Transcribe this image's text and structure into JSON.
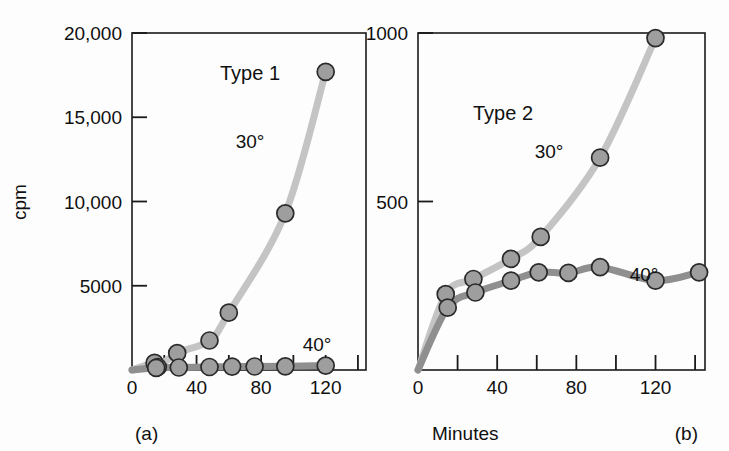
{
  "figure": {
    "background_color": "#fdfdfd",
    "axis_color": "#1a1a1a",
    "marker_fill": "#9e9e9e",
    "marker_stroke": "#2a2a2a",
    "curve_color_30": "#c4c4c4",
    "curve_color_40": "#8f8f8f",
    "shared_xlabel": "Minutes"
  },
  "panels": {
    "a": {
      "letter": "(a)",
      "title": "Type 1",
      "ylabel": "cpm",
      "y_ticks": [
        "5000",
        "10,000",
        "15,000",
        "20,000"
      ],
      "x_ticks": [
        "0",
        "40",
        "80",
        "120"
      ],
      "series_labels": {
        "hot": "30°",
        "cold": "40°"
      }
    },
    "b": {
      "letter": "(b)",
      "title": "Type 2",
      "ylabel": "",
      "y_ticks": [
        "500",
        "1000"
      ],
      "x_ticks": [
        "0",
        "40",
        "80",
        "120"
      ],
      "series_labels": {
        "hot": "30°",
        "cold": "40°"
      }
    }
  },
  "chart_data": [
    {
      "type": "line",
      "panel": "a",
      "title": "Type 1",
      "xlabel": "Minutes",
      "ylabel": "cpm",
      "xlim": [
        0,
        145
      ],
      "ylim": [
        0,
        20000
      ],
      "xticks": [
        0,
        20,
        40,
        60,
        80,
        100,
        120,
        140
      ],
      "xticklabels": [
        "0",
        "",
        "40",
        "",
        "80",
        "",
        "120",
        ""
      ],
      "yticks": [
        5000,
        10000,
        15000,
        20000
      ],
      "yticklabels": [
        "5000",
        "10,000",
        "15,000",
        "20,000"
      ],
      "grid": false,
      "legend": "inline-annotations",
      "series": [
        {
          "name": "30°",
          "color": "#c4c4c4",
          "x": [
            14,
            16,
            28,
            48,
            60,
            95,
            120
          ],
          "y": [
            420,
            180,
            1000,
            1750,
            3400,
            9300,
            17700
          ]
        },
        {
          "name": "40°",
          "color": "#8f8f8f",
          "x": [
            15,
            29,
            48,
            62,
            76,
            95,
            120
          ],
          "y": [
            130,
            150,
            180,
            200,
            210,
            220,
            260
          ]
        }
      ]
    },
    {
      "type": "line",
      "panel": "b",
      "title": "Type 2",
      "xlabel": "Minutes",
      "ylabel": "",
      "xlim": [
        0,
        145
      ],
      "ylim": [
        0,
        1000
      ],
      "xticks": [
        0,
        20,
        40,
        60,
        80,
        100,
        120,
        140
      ],
      "xticklabels": [
        "0",
        "",
        "40",
        "",
        "80",
        "",
        "120",
        ""
      ],
      "yticks": [
        500,
        1000
      ],
      "yticklabels": [
        "500",
        "1000"
      ],
      "grid": false,
      "legend": "inline-annotations",
      "series": [
        {
          "name": "30°",
          "color": "#c4c4c4",
          "x": [
            14,
            28,
            47,
            62,
            92,
            120
          ],
          "y": [
            225,
            270,
            330,
            395,
            630,
            985
          ]
        },
        {
          "name": "40°",
          "color": "#8f8f8f",
          "x": [
            15,
            29,
            47,
            61,
            76,
            92,
            120,
            142
          ],
          "y": [
            185,
            230,
            265,
            290,
            288,
            305,
            265,
            290
          ]
        }
      ]
    }
  ]
}
